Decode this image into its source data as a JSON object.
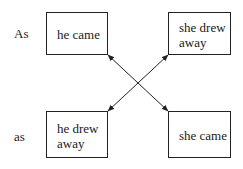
{
  "diagram": {
    "row_labels": [
      "As",
      "as"
    ],
    "boxes": [
      {
        "id": "top-left",
        "text": "he came"
      },
      {
        "id": "top-right",
        "text": "she drew\naway"
      },
      {
        "id": "bottom-left",
        "text": "he drew\naway"
      },
      {
        "id": "bottom-right",
        "text": "she came"
      }
    ],
    "connections": [
      {
        "from": "top-left",
        "to": "bottom-right",
        "style": "double-arrow"
      },
      {
        "from": "top-right",
        "to": "bottom-left",
        "style": "double-arrow"
      }
    ],
    "colors": {
      "line": "#222222",
      "background": "#ffffff"
    }
  }
}
